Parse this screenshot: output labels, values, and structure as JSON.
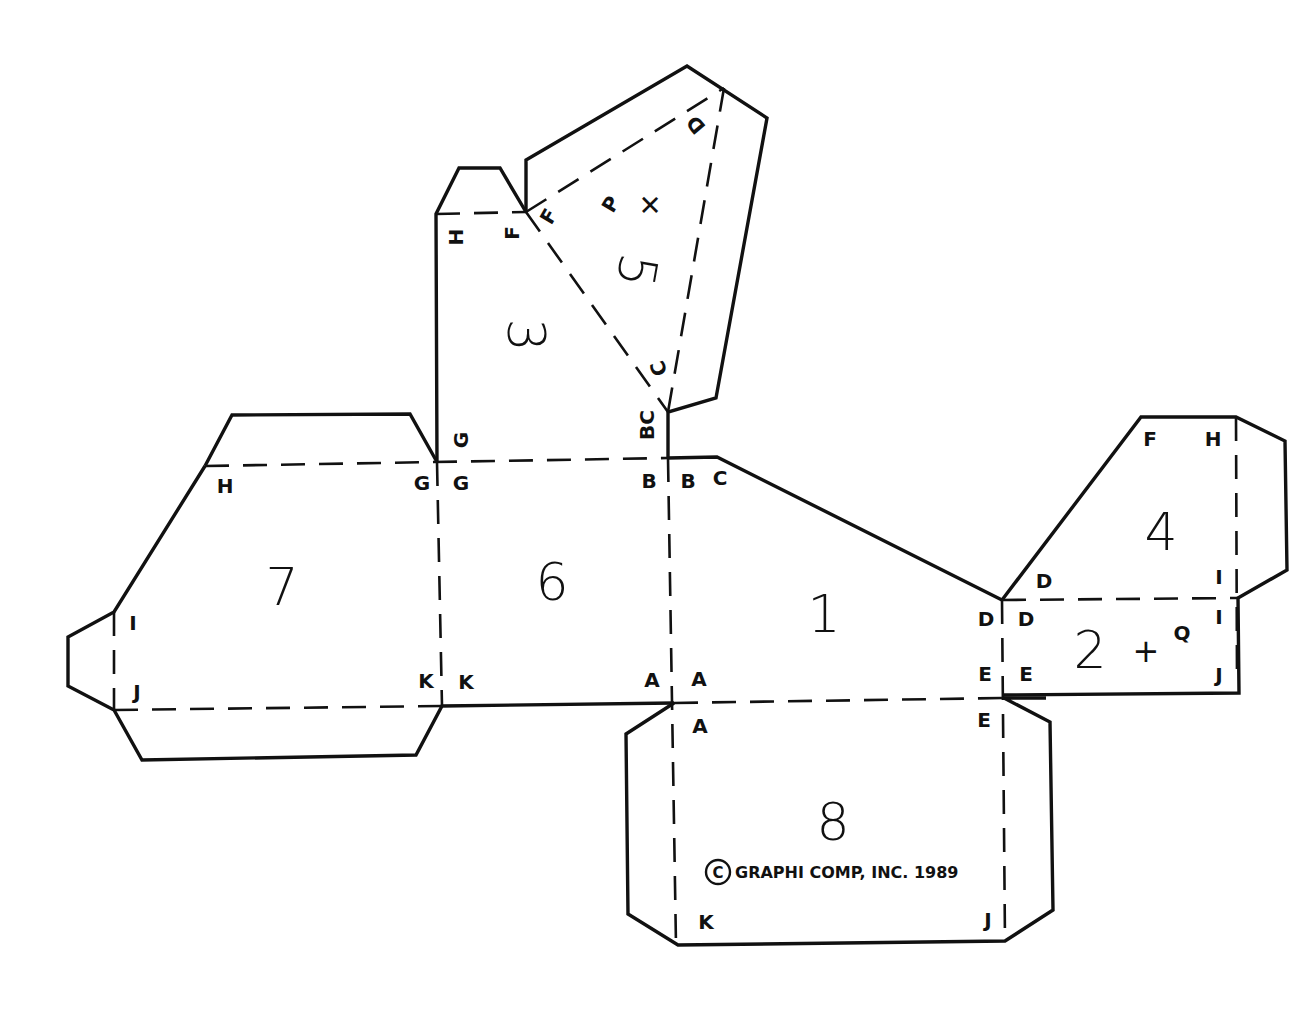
{
  "diagram": {
    "type": "paper-model-net",
    "panels": [
      {
        "id": "1",
        "label": "1"
      },
      {
        "id": "2",
        "label": "2"
      },
      {
        "id": "3",
        "label": "3"
      },
      {
        "id": "4",
        "label": "4"
      },
      {
        "id": "5",
        "label": "5"
      },
      {
        "id": "6",
        "label": "6"
      },
      {
        "id": "7",
        "label": "7"
      },
      {
        "id": "8",
        "label": "8"
      }
    ],
    "vertex_labels": {
      "p3_h": "H",
      "p3_f": "F",
      "p5_f": "F",
      "p5_p": "P",
      "p5_d": "D",
      "p5_c": "C",
      "p3_bc": "BC",
      "p6_g_top": "G",
      "p7_h": "H",
      "p7_g": "G",
      "p6_g": "G",
      "p6_b": "B",
      "p1_b": "B",
      "p1_c": "C",
      "p4_f": "F",
      "p4_h": "H",
      "p4_d": "D",
      "p4_i": "I",
      "p1_d": "D",
      "p2_d": "D",
      "p2_i": "I",
      "p2_q": "Q",
      "p1_e": "E",
      "p2_e": "E",
      "p2_j": "J",
      "p7_i": "I",
      "p7_j": "J",
      "p7_k": "K",
      "p6_k": "K",
      "p6_a": "A",
      "p1_a": "A",
      "p8_a": "A",
      "p8_e": "E",
      "p8_k": "K",
      "p8_j": "J"
    },
    "markers": {
      "cross_p": "+",
      "cross_q": "+"
    },
    "copyright": {
      "symbol": "C",
      "text": "GRAPHI COMP, INC. 1989"
    },
    "line_styles": {
      "cut": "solid",
      "fold": "dashed"
    },
    "colors": {
      "ink": "#111111",
      "paper": "#ffffff"
    }
  }
}
